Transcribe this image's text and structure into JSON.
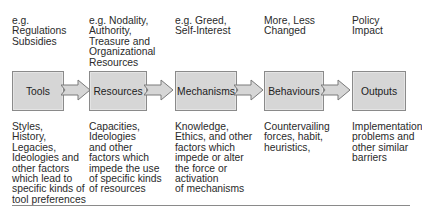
{
  "diagram": {
    "top_examples": [
      "e.g.\nRegulations\nSubsidies",
      "e.g. Nodality,\nAuthority,\nTreasure and\nOrganizational\nResources",
      "e.g. Greed,\nSelf-Interest",
      "More, Less\nChanged",
      "Policy\nImpact"
    ],
    "boxes": [
      {
        "label": "Tools"
      },
      {
        "label": "Resources"
      },
      {
        "label": "Mechanisms"
      },
      {
        "label": "Behaviours"
      },
      {
        "label": "Outputs"
      }
    ],
    "bottom_factors": [
      "Styles,\nHistory,\nLegacies,\nIdeologies and\nother factors\nwhich lead to\nspecific kinds of\ntool preferences",
      "Capacities,\nIdeologies\nand other\nfactors which\nimpede the use\nof specific kinds\nof resources",
      "Knowledge,\nEthics, and other\nfactors which\nimpede or alter\nthe force or\nactivation\nof mechanisms",
      "Countervailing\nforces, habit,\nheuristics,",
      "Implementation\nproblems and\nother similar\nbarriers"
    ],
    "colors": {
      "box_fill": "#d6d6d6",
      "box_border": "#8a8a8a",
      "arrow_fill": "#d6d6d6",
      "text": "#2a2a2a"
    }
  }
}
